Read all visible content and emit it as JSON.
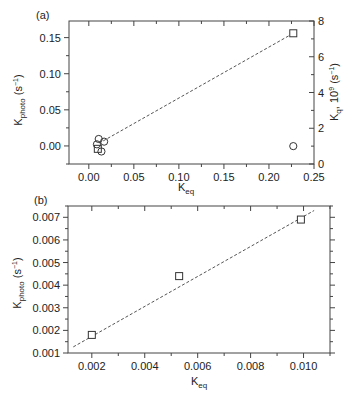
{
  "chart_data": [
    {
      "panel_label": "(a)",
      "type": "scatter",
      "xlabel": "K_eq",
      "ylabel": "K_photo (s^-1)",
      "y2label": "K_q, 10^9 (s^-1)",
      "xlim": [
        -0.022,
        0.25
      ],
      "ylim": [
        -0.025,
        0.173
      ],
      "y2lim": [
        0,
        8
      ],
      "xticks": [
        "0.00",
        "0.05",
        "0.10",
        "0.15",
        "0.20",
        "0.25"
      ],
      "xtick_values": [
        0.0,
        0.05,
        0.1,
        0.15,
        0.2,
        0.25
      ],
      "yticks": [
        "0.00",
        "0.05",
        "0.10",
        "0.15"
      ],
      "ytick_values": [
        0.0,
        0.05,
        0.1,
        0.15
      ],
      "y2ticks": [
        "0",
        "2",
        "4",
        "6",
        "8"
      ],
      "y2tick_values": [
        0,
        2,
        4,
        6,
        8
      ],
      "grid": false,
      "series": [
        {
          "name": "K_photo",
          "marker": "square",
          "axis": "left",
          "x": [
            0.01,
            0.227
          ],
          "y": [
            -0.004,
            0.156
          ]
        },
        {
          "name": "K_q",
          "marker": "circle",
          "axis": "right",
          "x": [
            0.011,
            0.009,
            0.017,
            0.014,
            0.227
          ],
          "y": [
            1.4,
            1.1,
            1.25,
            0.7,
            1.0
          ]
        }
      ],
      "fit_line": {
        "style": "dashed",
        "x": [
          0.016,
          0.227
        ],
        "y": [
          0.007,
          0.156
        ]
      }
    },
    {
      "panel_label": "(b)",
      "type": "scatter",
      "xlabel": "K_eq",
      "ylabel": "K_photo (s^-1)",
      "xlim": [
        0.0011,
        0.011
      ],
      "ylim": [
        0.001,
        0.0075
      ],
      "xticks": [
        "0.002",
        "0.004",
        "0.006",
        "0.008",
        "0.010"
      ],
      "xtick_values": [
        0.002,
        0.004,
        0.006,
        0.008,
        0.01
      ],
      "yticks": [
        "0.001",
        "0.002",
        "0.003",
        "0.004",
        "0.005",
        "0.006",
        "0.007"
      ],
      "ytick_values": [
        0.001,
        0.002,
        0.003,
        0.004,
        0.005,
        0.006,
        0.007
      ],
      "grid": false,
      "series": [
        {
          "name": "K_photo",
          "marker": "square",
          "axis": "left",
          "x": [
            0.002,
            0.0053,
            0.0099
          ],
          "y": [
            0.0018,
            0.0044,
            0.0069
          ]
        }
      ],
      "fit_line": {
        "style": "dashed",
        "x": [
          0.0013,
          0.0104
        ],
        "y": [
          0.00127,
          0.0073
        ]
      }
    }
  ],
  "labels": {
    "panel_a": "(a)",
    "panel_b": "(b)",
    "a_ylabel_main": "K",
    "a_ylabel_sub": "photo",
    "a_ylabel_unit": " (s",
    "a_ylabel_exp": "−1",
    "a_ylabel_close": ")",
    "a_y2label_main": "K",
    "a_y2label_sub": "q",
    "a_y2label_mid": ", 10",
    "a_y2label_exp9": "9",
    "a_y2label_unit": " (s",
    "a_y2label_exp": "−1",
    "a_y2label_close": ")",
    "a_xlabel_main": "K",
    "a_xlabel_sub": "eq",
    "b_ylabel_main": "K",
    "b_ylabel_sub": "photo",
    "b_ylabel_unit": " (s",
    "b_ylabel_exp": "−1",
    "b_ylabel_close": ")",
    "b_xlabel_main": "K",
    "b_xlabel_sub": "eq"
  }
}
